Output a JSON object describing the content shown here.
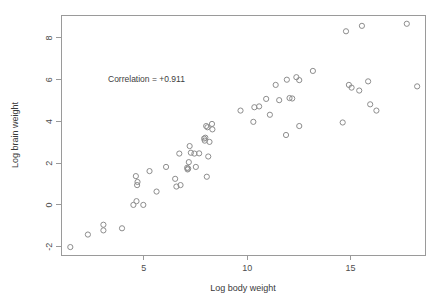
{
  "chart_data": {
    "type": "scatter",
    "title": "",
    "xlabel": "Log body weight",
    "ylabel": "Log brain weight",
    "annotation": "Correlation = +0.911",
    "xlim": [
      1.0,
      18.6
    ],
    "ylim": [
      -2.4,
      9.1
    ],
    "xticks": [
      5,
      10,
      15
    ],
    "yticks": [
      -2,
      0,
      2,
      4,
      6,
      8
    ],
    "grid": false,
    "legend": null,
    "marker": "open-circle",
    "marker_color": "#8d8d8d",
    "points": [
      {
        "x": 1.45,
        "y": -2.02
      },
      {
        "x": 2.3,
        "y": -1.42
      },
      {
        "x": 3.05,
        "y": -0.95
      },
      {
        "x": 3.05,
        "y": -1.22
      },
      {
        "x": 3.95,
        "y": -1.12
      },
      {
        "x": 4.5,
        "y": 0.0
      },
      {
        "x": 4.65,
        "y": 0.18
      },
      {
        "x": 4.62,
        "y": 1.38
      },
      {
        "x": 4.7,
        "y": 1.1
      },
      {
        "x": 4.68,
        "y": 0.95
      },
      {
        "x": 4.98,
        "y": 0.0
      },
      {
        "x": 5.28,
        "y": 1.62
      },
      {
        "x": 5.62,
        "y": 0.64
      },
      {
        "x": 6.08,
        "y": 1.82
      },
      {
        "x": 6.52,
        "y": 1.25
      },
      {
        "x": 6.58,
        "y": 0.88
      },
      {
        "x": 6.72,
        "y": 2.46
      },
      {
        "x": 6.78,
        "y": 0.95
      },
      {
        "x": 7.1,
        "y": 1.78
      },
      {
        "x": 7.12,
        "y": 1.7
      },
      {
        "x": 7.15,
        "y": 1.74
      },
      {
        "x": 7.18,
        "y": 2.05
      },
      {
        "x": 7.22,
        "y": 2.82
      },
      {
        "x": 7.28,
        "y": 2.5
      },
      {
        "x": 7.45,
        "y": 2.46
      },
      {
        "x": 7.52,
        "y": 1.82
      },
      {
        "x": 7.68,
        "y": 2.47
      },
      {
        "x": 7.92,
        "y": 3.18
      },
      {
        "x": 7.95,
        "y": 3.08
      },
      {
        "x": 7.98,
        "y": 3.22
      },
      {
        "x": 8.02,
        "y": 3.78
      },
      {
        "x": 8.08,
        "y": 3.72
      },
      {
        "x": 8.05,
        "y": 1.35
      },
      {
        "x": 8.12,
        "y": 2.32
      },
      {
        "x": 8.18,
        "y": 3.02
      },
      {
        "x": 8.3,
        "y": 3.88
      },
      {
        "x": 8.32,
        "y": 3.62
      },
      {
        "x": 9.68,
        "y": 4.52
      },
      {
        "x": 10.35,
        "y": 4.68
      },
      {
        "x": 10.3,
        "y": 3.98
      },
      {
        "x": 10.58,
        "y": 4.72
      },
      {
        "x": 10.92,
        "y": 5.08
      },
      {
        "x": 11.1,
        "y": 4.32
      },
      {
        "x": 11.38,
        "y": 5.75
      },
      {
        "x": 11.55,
        "y": 5.02
      },
      {
        "x": 11.92,
        "y": 6.0
      },
      {
        "x": 12.05,
        "y": 5.12
      },
      {
        "x": 12.18,
        "y": 5.1
      },
      {
        "x": 11.88,
        "y": 3.35
      },
      {
        "x": 12.38,
        "y": 6.12
      },
      {
        "x": 12.52,
        "y": 5.98
      },
      {
        "x": 12.52,
        "y": 3.78
      },
      {
        "x": 13.18,
        "y": 6.42
      },
      {
        "x": 14.62,
        "y": 3.95
      },
      {
        "x": 14.78,
        "y": 8.32
      },
      {
        "x": 14.92,
        "y": 5.75
      },
      {
        "x": 15.05,
        "y": 5.62
      },
      {
        "x": 15.42,
        "y": 5.48
      },
      {
        "x": 15.55,
        "y": 8.58
      },
      {
        "x": 15.85,
        "y": 5.92
      },
      {
        "x": 15.95,
        "y": 4.82
      },
      {
        "x": 16.25,
        "y": 4.52
      },
      {
        "x": 17.72,
        "y": 8.68
      },
      {
        "x": 18.22,
        "y": 5.68
      }
    ]
  },
  "plot_frame": {
    "left": 61,
    "top": 15,
    "right": 425,
    "bottom": 255,
    "border_color": "#9a9a9a"
  },
  "background_color": "#ffffff"
}
